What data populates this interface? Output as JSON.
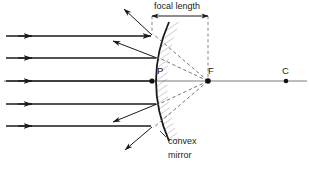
{
  "diagram": {
    "labels": {
      "focal_length": "focal length",
      "pole": "P",
      "focus": "F",
      "centre_of_curvature": "C",
      "mirror_line1": "convex",
      "mirror_line2": "mirror"
    },
    "colors": {
      "stroke": "#1a1a1a",
      "axis": "#555555",
      "dashed": "#555555",
      "hatch": "#777777",
      "background": "#ffffff"
    },
    "geometry": {
      "pole_x": 152,
      "pole_y": 81,
      "focus_x": 208,
      "focus_y": 81,
      "centre_x": 286,
      "centre_y": 81,
      "axis_y": 81,
      "focal_length_px": 56,
      "incident_ray_y": [
        36,
        58,
        81,
        104,
        126
      ],
      "incident_ray_start_x": 6,
      "mirror_top_y": 22,
      "mirror_bottom_y": 141
    }
  }
}
